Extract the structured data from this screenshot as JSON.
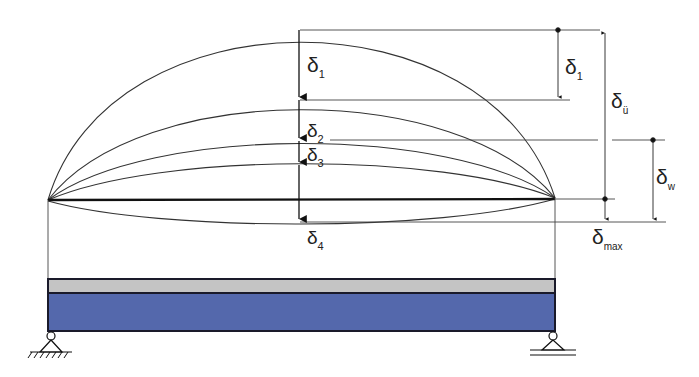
{
  "diagram": {
    "type": "beam-deflection",
    "labels": {
      "d1_center": {
        "main": "δ",
        "sub": "1"
      },
      "d2_center": {
        "main": "δ",
        "sub": "2"
      },
      "d3_center": {
        "main": "δ",
        "sub": "3"
      },
      "d4_center": {
        "main": "δ",
        "sub": "4"
      },
      "d1_right": {
        "main": "δ",
        "sub": "1"
      },
      "du_right": {
        "main": "δ",
        "sub": "ü"
      },
      "dw_right": {
        "main": "δ",
        "sub": "w"
      },
      "dmax_right": {
        "main": "δ",
        "sub": "max"
      }
    },
    "colors": {
      "line": "#222222",
      "beam_top": "#c4c4c4",
      "beam_bottom": "#5468ac",
      "beam_outline": "#1a1a2a"
    }
  }
}
